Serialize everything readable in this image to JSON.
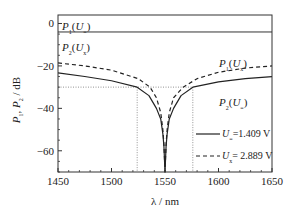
{
  "chart_data": {
    "type": "line",
    "title": "",
    "xlabel": "λ / nm",
    "ylabel": "P1, P2 / dB",
    "xlim": [
      1450,
      1650
    ],
    "ylim": [
      -70,
      4
    ],
    "xticks": [
      1450,
      1500,
      1550,
      1600,
      1650
    ],
    "yticks": [
      0,
      -20,
      -40,
      -60
    ],
    "grid": false,
    "top_panel": {
      "level_db": -4,
      "labels": [
        {
          "base": "P",
          "base_sub": "1",
          "arg": "U",
          "arg_sub": "="
        },
        {
          "base": "P",
          "base_sub": "2",
          "arg": "U",
          "arg_sub": "x"
        }
      ]
    },
    "reference_lines": {
      "horizontal_db": -30,
      "vertical_nm": [
        1524,
        1576
      ]
    },
    "series": [
      {
        "name": "U= = 1.409 V",
        "style": "solid",
        "x": [
          1450,
          1475,
          1500,
          1524,
          1535,
          1542,
          1546,
          1548,
          1549,
          1550,
          1551,
          1552,
          1554,
          1558,
          1565,
          1576,
          1600,
          1625,
          1650
        ],
        "y": [
          -23.3,
          -25,
          -27,
          -30,
          -34,
          -40,
          -45,
          -52,
          -58,
          -70,
          -58,
          -52,
          -45,
          -40,
          -34,
          -30,
          -27.5,
          -26,
          -25
        ]
      },
      {
        "name": "Ux = 2.889 V",
        "style": "dashed",
        "x": [
          1450,
          1475,
          1500,
          1525,
          1536,
          1542,
          1546,
          1548,
          1549,
          1550,
          1551,
          1552,
          1554,
          1558,
          1567,
          1580,
          1600,
          1625,
          1650
        ],
        "y": [
          -18.6,
          -20,
          -22,
          -26,
          -30,
          -35,
          -42,
          -50,
          -57,
          -70,
          -57,
          -50,
          -42,
          -35,
          -30,
          -26,
          -23,
          -21,
          -20
        ]
      }
    ],
    "curve_labels": [
      {
        "base": "P",
        "base_sub": "1",
        "arg": "U",
        "arg_sub": "x",
        "near": "dashed-right"
      },
      {
        "base": "P",
        "base_sub": "2",
        "arg": "U",
        "arg_sub": "=",
        "near": "solid-right"
      }
    ],
    "legend": {
      "placement": "lower-right",
      "entries": [
        {
          "style": "solid",
          "var": "U",
          "sub": "=",
          "text": "=1.409 V"
        },
        {
          "style": "dashed",
          "var": "U",
          "sub": "x",
          "text": "= 2.889 V"
        }
      ]
    }
  }
}
